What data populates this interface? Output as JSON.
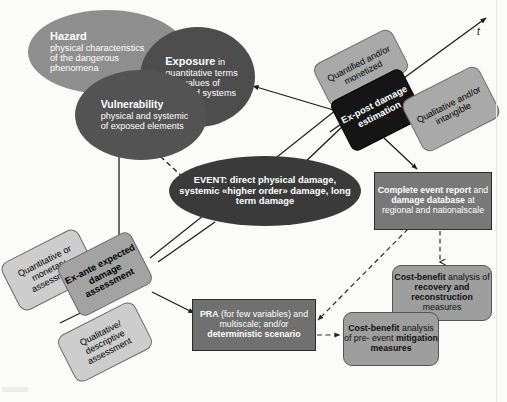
{
  "diagram": {
    "axis": {
      "label": "t",
      "name": "time-axis"
    },
    "colors": {
      "hazard": "#8e8e8e",
      "exposure": "#4d4d4d",
      "vulnerability": "#535353",
      "event": "#3a3a3a",
      "expost": "#151515",
      "light_box": "#a9a9a9",
      "pale_box": "#cdcdcd",
      "exante": "#a3a3a3",
      "report": "#787878",
      "pra": "#707070",
      "cost_benefit": "#9e9e9e"
    }
  },
  "nodes": {
    "hazard": {
      "title": "Hazard",
      "body": "physical characteristics of the dangerous phenomena",
      "line1": "physical characteristics",
      "line2": "of the dangerous",
      "line3": "phenomena"
    },
    "exposure": {
      "title": "Exposure",
      "title_tail": " in",
      "line1": "quantitative terms",
      "line2": "and values of",
      "line3": "exposed systems"
    },
    "vulnerability": {
      "title": "Vulnerability",
      "line1": "physical and systemic",
      "line2": "of exposed elements"
    },
    "event": {
      "line1": "EVENT: direct physical",
      "line2": "damage, systemic «higher",
      "line3": "order» damage, long term",
      "line4": "damage"
    },
    "quantified": {
      "line1": "Quantified",
      "line2": "and/or monetized"
    },
    "expost": {
      "line1": "Ex-post",
      "line2": "damage",
      "line3": "estimation"
    },
    "qualitative_intangible": {
      "line1": "Qualitative and/or",
      "line2": "intangible"
    },
    "report": {
      "line1": "Complete event report",
      "line2_plain": "and ",
      "line2_bold": "damage database",
      "line3": "at regional and",
      "line4": "nationalscale"
    },
    "quantitative_monetary": {
      "line1": "Quantitative",
      "line2": "or monetary",
      "line3": "assessment"
    },
    "exante": {
      "line1": "Ex-ante",
      "line2": "expected",
      "line3": "damage",
      "line4": "assessment"
    },
    "qualitative_descriptive": {
      "line1": "Qualitative/",
      "line2": "descriptive",
      "line3": "assessment"
    },
    "pra": {
      "line1_bold": "PRA",
      "line1_plain": " (for few",
      "line2": "variables) and",
      "line3": "multiscale; and/or",
      "line4": "deterministic scenario"
    },
    "cost_benefit_recovery": {
      "line1": "Cost-benefit",
      "line2_plain": "analysis of ",
      "line2_bold": "recovery",
      "line3_bold": "and reconstruction",
      "line4": "measures"
    },
    "cost_benefit_mitigation": {
      "line1": "Cost-benefit",
      "line2": "analysis of pre-",
      "line3_plain": "event ",
      "line3_bold": "mitigation",
      "line4_bold": "measures"
    }
  }
}
